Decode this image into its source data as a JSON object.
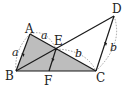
{
  "diagram": {
    "points": {
      "A": {
        "label": "A",
        "x": 30,
        "y": 34
      },
      "B": {
        "label": "B",
        "x": 16,
        "y": 71
      },
      "C": {
        "label": "C",
        "x": 96,
        "y": 71
      },
      "D": {
        "label": "D",
        "x": 114,
        "y": 16
      },
      "E": {
        "label": "E",
        "x": 56,
        "y": 49
      },
      "F": {
        "label": "F",
        "x": 49,
        "y": 71
      }
    },
    "lengths": {
      "AB": "a",
      "AE": "a",
      "EC": "b",
      "CD": "b"
    },
    "colors": {
      "fill": "#bdbdbd",
      "stroke": "#1a1a1a",
      "dashed": "#888888"
    }
  }
}
